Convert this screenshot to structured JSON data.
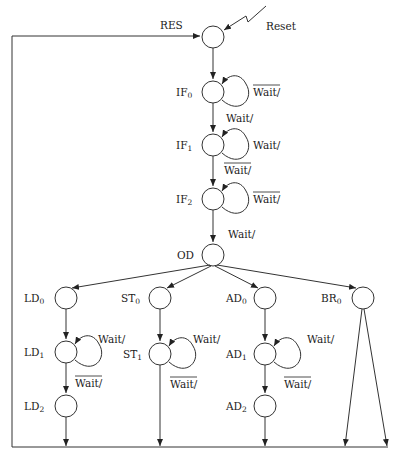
{
  "diagram": {
    "type": "state-machine",
    "external_input": "Reset",
    "return_label": "RES",
    "states": [
      {
        "id": "RES",
        "label": "",
        "sub": ""
      },
      {
        "id": "IF0",
        "label": "IF",
        "sub": "0"
      },
      {
        "id": "IF1",
        "label": "IF",
        "sub": "1"
      },
      {
        "id": "IF2",
        "label": "IF",
        "sub": "2"
      },
      {
        "id": "OD",
        "label": "OD",
        "sub": ""
      },
      {
        "id": "LD0",
        "label": "LD",
        "sub": "0"
      },
      {
        "id": "LD1",
        "label": "LD",
        "sub": "1"
      },
      {
        "id": "LD2",
        "label": "LD",
        "sub": "2"
      },
      {
        "id": "ST0",
        "label": "ST",
        "sub": "0"
      },
      {
        "id": "ST1",
        "label": "ST",
        "sub": "1"
      },
      {
        "id": "AD0",
        "label": "AD",
        "sub": "0"
      },
      {
        "id": "AD1",
        "label": "AD",
        "sub": "1"
      },
      {
        "id": "AD2",
        "label": "AD",
        "sub": "2"
      },
      {
        "id": "BR0",
        "label": "BR",
        "sub": "0"
      }
    ],
    "transitions": {
      "if0_self": {
        "text": "Wait/",
        "negated": true
      },
      "if0_to_if1": {
        "text": "Wait/",
        "negated": false
      },
      "if1_self": {
        "text": "Wait/",
        "negated": false
      },
      "if1_to_if2": {
        "text": "Wait/",
        "negated": true
      },
      "if2_self": {
        "text": "Wait/",
        "negated": true
      },
      "if2_to_od": {
        "text": "Wait/",
        "negated": false
      },
      "ld1_self": {
        "text": "Wait/",
        "negated": false
      },
      "ld1_to_ld2": {
        "text": "Wait/",
        "negated": true
      },
      "st1_self": {
        "text": "Wait/",
        "negated": false
      },
      "st1_exit": {
        "text": "Wait/",
        "negated": true
      },
      "ad1_self": {
        "text": "Wait/",
        "negated": false
      },
      "ad1_to_ad2": {
        "text": "Wait/",
        "negated": true
      }
    }
  }
}
